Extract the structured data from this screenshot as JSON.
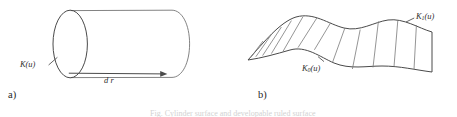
{
  "figure": {
    "background_color": "#ffffff",
    "ink_color": "#4a4a4a",
    "width": 457,
    "height": 117,
    "clipped_bottom_caption": "Fig. Cylinder surface and developable ruled surface"
  },
  "panel_a": {
    "caption": "a)",
    "curve_label": "K(u)",
    "direction_label": "d r",
    "shape_name": "cylinder",
    "generator_curve": "K(u)",
    "direction_vector": "d r"
  },
  "panel_b": {
    "caption": "b)",
    "upper_curve_label_base": "K",
    "upper_curve_label_sub": "1",
    "upper_curve_label_tail": "(u)",
    "lower_curve_label_base": "K",
    "lower_curve_label_sub": "0",
    "lower_curve_label_tail": "(u)",
    "shape_name": "ruled-surface",
    "ruling_count": 12
  }
}
